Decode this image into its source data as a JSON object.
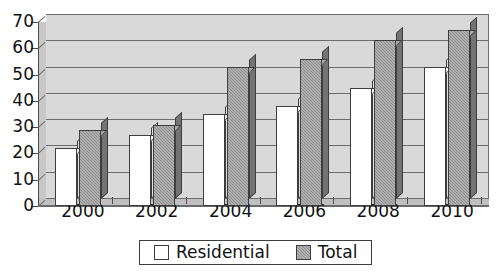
{
  "chart_data": {
    "type": "bar",
    "title": "",
    "subtitle": "",
    "xlabel": "",
    "ylabel": "",
    "categories": [
      "2000",
      "2002",
      "2004",
      "2006",
      "2008",
      "2010"
    ],
    "series": [
      {
        "name": "Residential",
        "values": [
          22,
          27,
          35,
          38,
          45,
          53
        ],
        "color": "#ffffff"
      },
      {
        "name": "Total",
        "values": [
          29,
          31,
          53,
          56,
          63,
          67
        ],
        "color": "#8f8f8f"
      }
    ],
    "ylim": [
      0,
      70
    ],
    "ytick_labels": [
      "70",
      "60",
      "50",
      "40",
      "30",
      "20",
      "10",
      "0"
    ],
    "ytick_values": [
      70,
      60,
      50,
      40,
      30,
      20,
      10,
      0
    ],
    "grid": true,
    "legend_position": "bottom",
    "style": "3d-column"
  },
  "legend": {
    "items": [
      {
        "label": "Residential",
        "swatch": "open-square-swatch"
      },
      {
        "label": "Total",
        "swatch": "filled-square-swatch"
      }
    ]
  },
  "colors": {
    "plot_background": "#d9d9d9",
    "axis_line": "#6b6b6b",
    "residential_bar": "#ffffff",
    "total_bar": "#8f8f8f",
    "text": "#111111",
    "page_background": "#ffffff"
  }
}
